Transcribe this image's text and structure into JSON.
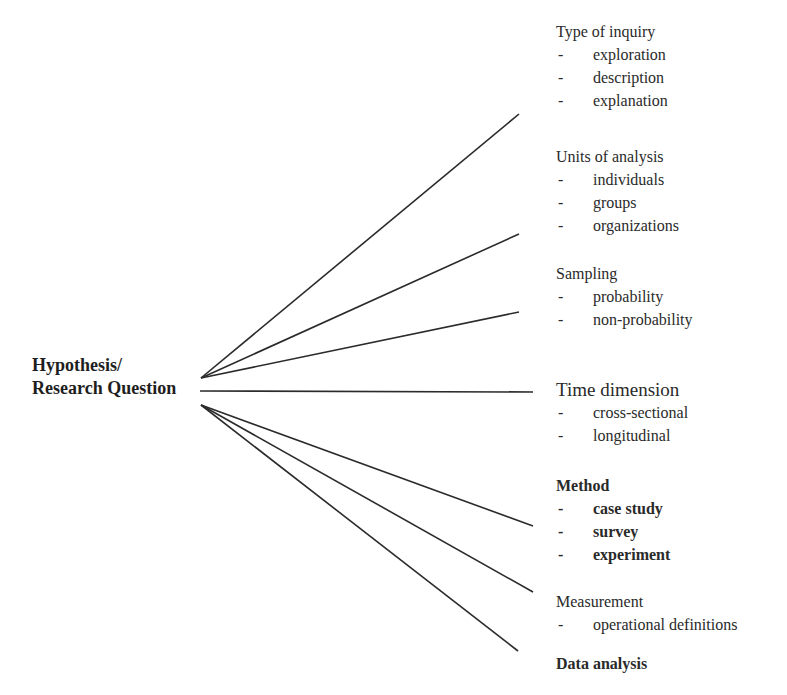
{
  "root": {
    "line1": "Hypothesis/",
    "line2": "Research Question"
  },
  "groups": [
    {
      "title": "Type of inquiry",
      "items": [
        "exploration",
        "description",
        "explanation"
      ]
    },
    {
      "title": "Units of analysis",
      "items": [
        "individuals",
        "groups",
        "organizations"
      ]
    },
    {
      "title": "Sampling",
      "items": [
        "probability",
        "non-probability"
      ]
    },
    {
      "title": "Time dimension",
      "items": [
        "cross-sectional",
        "longitudinal"
      ]
    },
    {
      "title": "Method",
      "items": [
        "case study",
        "survey",
        "experiment"
      ]
    },
    {
      "title": "Measurement",
      "items": [
        "operational definitions"
      ]
    },
    {
      "title": "Data analysis",
      "items": []
    }
  ],
  "dash": "-",
  "colors": {
    "line": "#2b2b2b",
    "text": "#222222"
  }
}
